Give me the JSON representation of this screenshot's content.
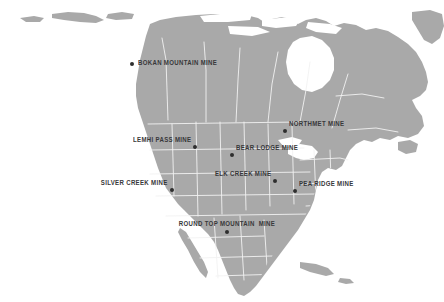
{
  "map": {
    "title": "North America Rare Earth Mine Locations",
    "region": "North America",
    "background_color": "#ffffff",
    "land_color": "#a9a9a9",
    "border_color": "#f2f2f2",
    "label_color": "#38383a",
    "marker_color": "#2e2e2e"
  },
  "mines": [
    {
      "id": "bokan-mountain",
      "label": "BOKAN MOUNTAIN MINE",
      "x": 132,
      "y": 64,
      "label_position": "right"
    },
    {
      "id": "northmet",
      "label": "NORTHMET MINE",
      "x": 285,
      "y": 131,
      "label_position": "upright"
    },
    {
      "id": "lemhi-pass",
      "label": "LEMHI PASS MINE",
      "x": 195,
      "y": 147,
      "label_position": "upleft"
    },
    {
      "id": "bear-lodge",
      "label": "BEAR LODGE MINE",
      "x": 232,
      "y": 155,
      "label_position": "upright"
    },
    {
      "id": "elk-creek",
      "label": "ELK CREEK MINE",
      "x": 275,
      "y": 181,
      "label_position": "upleft"
    },
    {
      "id": "pea-ridge",
      "label": "PEA RIDGE MINE",
      "x": 295,
      "y": 191,
      "label_position": "upright"
    },
    {
      "id": "silver-creek",
      "label": "SILVER CREEK MINE",
      "x": 172,
      "y": 190,
      "label_position": "upleft"
    },
    {
      "id": "round-top-mountain",
      "label": "ROUND TOP MOUNTAIN  MINE",
      "x": 227,
      "y": 232,
      "label_position": "above"
    }
  ]
}
